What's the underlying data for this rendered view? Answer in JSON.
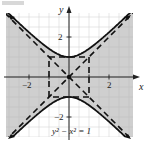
{
  "chart_data": {
    "type": "line",
    "title": "",
    "equation_label": "y² − x² = 1",
    "xlabel": "x",
    "ylabel": "y",
    "xlim": [
      -3.2,
      3.2
    ],
    "ylim": [
      -3.2,
      3.2
    ],
    "x_tick_labels": [
      "−2",
      "2"
    ],
    "y_tick_labels": [
      "2",
      "−2"
    ],
    "grid": true,
    "grid_step": 0.5,
    "shaded_region": "between branches, y² − x² < 1",
    "series": [
      {
        "name": "upper branch",
        "equation": "y = sqrt(1 + x^2)",
        "style": "solid",
        "vertex": [
          0,
          1
        ]
      },
      {
        "name": "lower branch",
        "equation": "y = -sqrt(1 + x^2)",
        "style": "solid",
        "vertex": [
          0,
          -1
        ]
      },
      {
        "name": "asymptote",
        "equation": "y = x",
        "style": "dashed"
      },
      {
        "name": "asymptote",
        "equation": "y = -x",
        "style": "dashed"
      },
      {
        "name": "fundamental rectangle",
        "corners": [
          [
            -1,
            -1
          ],
          [
            1,
            1
          ]
        ],
        "style": "dashed"
      }
    ],
    "points": [
      {
        "x": 0,
        "y": 0,
        "label": "center"
      }
    ]
  },
  "labels": {
    "x_axis": "x",
    "y_axis": "y",
    "x_neg2": "−2",
    "x_pos2": "2",
    "y_pos2": "2",
    "y_neg2": "−2",
    "equation": "y² − x² = 1"
  },
  "colors": {
    "shade": "#cfcfcf",
    "grid": "#e2e2e2",
    "curve": "#111111"
  }
}
